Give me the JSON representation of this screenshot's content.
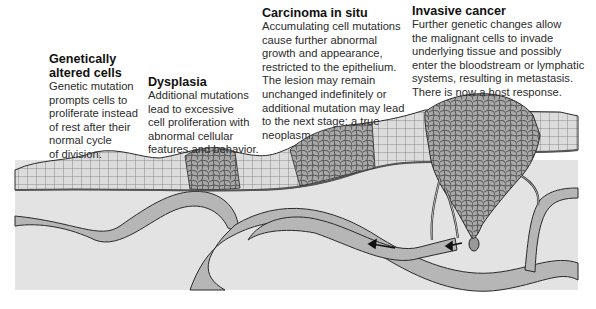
{
  "figure": {
    "colors": {
      "background": "#ffffff",
      "connective_tissue": "#e3e3e3",
      "vessel_fill": "#b6b6b6",
      "normal_cells": "#dcdcdc",
      "abnormal_cells": "#a9a9a9",
      "outline": "#2a2a2a"
    }
  },
  "stages": [
    {
      "title_lines": [
        "Genetically",
        "altered cells"
      ],
      "body_lines": [
        "Genetic mutation",
        "prompts cells to",
        "proliferate instead",
        "of rest after their",
        "normal cycle",
        "of division."
      ]
    },
    {
      "title_lines": [
        "Dysplasia"
      ],
      "body_lines": [
        "Additional mutations",
        "lead to excessive",
        "cell proliferation with",
        "abnormal cellular",
        "features and behavior."
      ]
    },
    {
      "title_lines": [
        "Carcinoma in situ"
      ],
      "body_lines": [
        "Accumulating cell mutations",
        "cause further abnormal",
        "growth and appearance,",
        "restricted to the epithelium.",
        "The lesion may remain",
        "unchanged indefinitely or",
        "additional mutation may lead",
        "to the next stage: a true",
        "neoplasm."
      ]
    },
    {
      "title_lines": [
        "Invasive cancer"
      ],
      "body_lines": [
        "Further genetic changes allow",
        "the malignant cells to invade",
        "underlying tissue and possibly",
        "enter the bloodstream or lymphatic",
        "systems, resulting in metastasis.",
        "There is now a host response."
      ]
    }
  ]
}
